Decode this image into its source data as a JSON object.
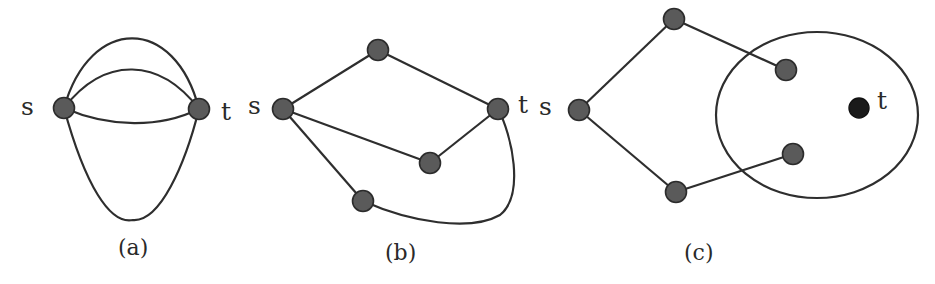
{
  "figure": {
    "panels": [
      {
        "id": "a",
        "caption": "(a)",
        "source_label": "s",
        "target_label": "t",
        "description": "Two vertices s and t joined by four parallel curved edges"
      },
      {
        "id": "b",
        "caption": "(b)",
        "source_label": "s",
        "target_label": "t",
        "description": "s-t graph with three internal vertices forming three s-t paths"
      },
      {
        "id": "c",
        "caption": "(c)",
        "source_label": "s",
        "target_label": "t",
        "description": "Source s with two paths leading into an elliptical region containing t"
      }
    ],
    "colors": {
      "node_fill": "#5a5a5a",
      "target_node_fill": "#1a1a1a",
      "edge": "#2e2e2e",
      "background": "#ffffff"
    }
  }
}
